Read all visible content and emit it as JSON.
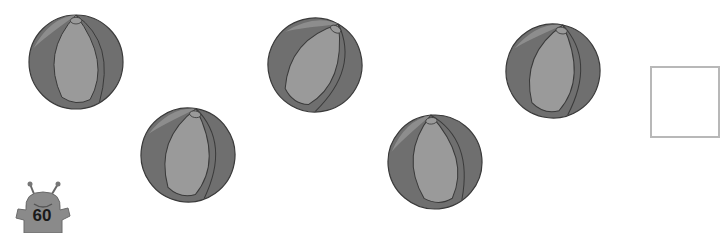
{
  "worksheet": {
    "balls": [
      {
        "cx": 76,
        "cy": 62,
        "r": 47,
        "rotate": 0
      },
      {
        "cx": 188,
        "cy": 155,
        "r": 47,
        "rotate": 10
      },
      {
        "cx": 315,
        "cy": 65,
        "r": 47,
        "rotate": 30
      },
      {
        "cx": 435,
        "cy": 162,
        "r": 47,
        "rotate": -5
      },
      {
        "cx": 553,
        "cy": 71,
        "r": 47,
        "rotate": 12
      }
    ],
    "answer_box": {
      "value": ""
    },
    "page_number": "60",
    "colors": {
      "dark_panel": "#6f6f6f",
      "light_panel": "#9a9a9a",
      "outline": "#3a3a3a",
      "box_border": "#b8b8b8",
      "mascot": "#8a8a8a"
    }
  }
}
